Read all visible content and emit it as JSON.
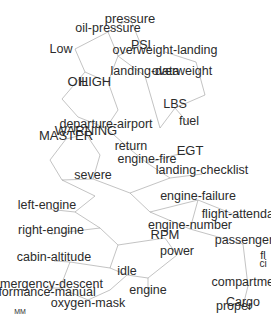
{
  "graph": {
    "title": "aviation-term-network",
    "background_color": "#ffffff",
    "edge_color": "#9a9a9a",
    "label_color": "#2b2b2b",
    "width": 271,
    "height": 324,
    "nodes": [
      {
        "label": "pressure",
        "x": 130,
        "y": 18,
        "size": 13
      },
      {
        "label": "oil-pressure",
        "x": 108,
        "y": 28,
        "size": 12.5
      },
      {
        "label": "PSI",
        "x": 141,
        "y": 45,
        "size": 12.5
      },
      {
        "label": "Low",
        "x": 61,
        "y": 49,
        "size": 12.5
      },
      {
        "label": "overweight-landing",
        "x": 165,
        "y": 50,
        "size": 12.5
      },
      {
        "label": "landing-data",
        "x": 145,
        "y": 71,
        "size": 12.5
      },
      {
        "label": "overweight",
        "x": 182,
        "y": 71,
        "size": 12.5
      },
      {
        "label": "OIL",
        "x": 78,
        "y": 81,
        "size": 13
      },
      {
        "label": "HIGH",
        "x": 95,
        "y": 81,
        "size": 13
      },
      {
        "label": "LBS",
        "x": 175,
        "y": 104,
        "size": 12.5
      },
      {
        "label": "departure-airport",
        "x": 106,
        "y": 124,
        "size": 12.5
      },
      {
        "label": "fuel",
        "x": 189,
        "y": 121,
        "size": 12.5
      },
      {
        "label": "WARNING",
        "x": 86,
        "y": 130,
        "size": 13
      },
      {
        "label": "MASTER",
        "x": 66,
        "y": 135,
        "size": 13
      },
      {
        "label": "return",
        "x": 131,
        "y": 146,
        "size": 12.5
      },
      {
        "label": "EGT",
        "x": 190,
        "y": 150,
        "size": 13
      },
      {
        "label": "engine-fire",
        "x": 147,
        "y": 159,
        "size": 12.5
      },
      {
        "label": "landing-checklist",
        "x": 202,
        "y": 170,
        "size": 12.5
      },
      {
        "label": "severe",
        "x": 93,
        "y": 175,
        "size": 12.5
      },
      {
        "label": "engine-failure",
        "x": 198,
        "y": 196,
        "size": 12.5
      },
      {
        "label": "left-engine",
        "x": 47,
        "y": 205,
        "size": 12.5
      },
      {
        "label": "flight-attendant",
        "x": 243,
        "y": 214,
        "size": 12.5
      },
      {
        "label": "engine-number",
        "x": 190,
        "y": 225,
        "size": 12.5
      },
      {
        "label": "right-engine",
        "x": 51,
        "y": 230,
        "size": 12.5
      },
      {
        "label": "RPM",
        "x": 165,
        "y": 234,
        "size": 13
      },
      {
        "label": "passenger",
        "x": 244,
        "y": 240,
        "size": 12.5
      },
      {
        "label": "power",
        "x": 177,
        "y": 251,
        "size": 12.5
      },
      {
        "label": "cabin-altitude",
        "x": 54,
        "y": 257,
        "size": 12.5
      },
      {
        "label": "fl",
        "x": 263,
        "y": 255,
        "size": 11
      },
      {
        "label": "ci",
        "x": 263,
        "y": 264,
        "size": 10
      },
      {
        "label": "idle",
        "x": 127,
        "y": 271,
        "size": 12.5
      },
      {
        "label": "emergency-descent",
        "x": 48,
        "y": 284,
        "size": 12.5
      },
      {
        "label": "compartment",
        "x": 248,
        "y": 282,
        "size": 12.5
      },
      {
        "label": "performance-manual",
        "x": 38,
        "y": 292,
        "size": 12.5
      },
      {
        "label": "engine",
        "x": 148,
        "y": 290,
        "size": 12.5
      },
      {
        "label": "oxygen-mask",
        "x": 88,
        "y": 303,
        "size": 12.5
      },
      {
        "label": "Cargo",
        "x": 243,
        "y": 302,
        "size": 12.5
      },
      {
        "label": "proper",
        "x": 234,
        "y": 306,
        "size": 12.5
      },
      {
        "label": "MM",
        "x": 20,
        "y": 311,
        "size": 7
      }
    ],
    "edges": [
      [
        130,
        18,
        108,
        32
      ],
      [
        130,
        18,
        141,
        45
      ],
      [
        108,
        32,
        75,
        49
      ],
      [
        108,
        32,
        118,
        56
      ],
      [
        141,
        45,
        118,
        56
      ],
      [
        75,
        49,
        85,
        72
      ],
      [
        118,
        56,
        145,
        76
      ],
      [
        118,
        56,
        108,
        82
      ],
      [
        165,
        52,
        196,
        62
      ],
      [
        196,
        62,
        205,
        95
      ],
      [
        205,
        95,
        175,
        108
      ],
      [
        175,
        108,
        189,
        124
      ],
      [
        175,
        108,
        160,
        128
      ],
      [
        145,
        76,
        160,
        128
      ],
      [
        108,
        82,
        85,
        72
      ],
      [
        85,
        72,
        62,
        99
      ],
      [
        108,
        82,
        118,
        110
      ],
      [
        62,
        99,
        78,
        117
      ],
      [
        78,
        117,
        106,
        128
      ],
      [
        118,
        110,
        106,
        128
      ],
      [
        106,
        128,
        131,
        150
      ],
      [
        131,
        150,
        147,
        163
      ],
      [
        147,
        163,
        175,
        155
      ],
      [
        175,
        155,
        190,
        153
      ],
      [
        147,
        163,
        170,
        178
      ],
      [
        170,
        178,
        202,
        174
      ],
      [
        66,
        139,
        50,
        160
      ],
      [
        86,
        134,
        66,
        139
      ],
      [
        86,
        134,
        100,
        155
      ],
      [
        100,
        155,
        93,
        179
      ],
      [
        50,
        160,
        62,
        180
      ],
      [
        62,
        180,
        93,
        179
      ],
      [
        93,
        179,
        130,
        193
      ],
      [
        130,
        193,
        170,
        178
      ],
      [
        130,
        193,
        150,
        212
      ],
      [
        150,
        212,
        198,
        200
      ],
      [
        198,
        200,
        243,
        218
      ],
      [
        150,
        212,
        190,
        229
      ],
      [
        190,
        229,
        243,
        244
      ],
      [
        95,
        196,
        62,
        180
      ],
      [
        95,
        196,
        75,
        212
      ],
      [
        75,
        212,
        47,
        209
      ],
      [
        75,
        212,
        100,
        228
      ],
      [
        100,
        228,
        51,
        234
      ],
      [
        100,
        228,
        118,
        245
      ],
      [
        118,
        245,
        165,
        238
      ],
      [
        165,
        238,
        177,
        255
      ],
      [
        177,
        255,
        148,
        278
      ],
      [
        118,
        245,
        110,
        268
      ],
      [
        110,
        268,
        127,
        275
      ],
      [
        127,
        275,
        148,
        278
      ],
      [
        110,
        268,
        70,
        262
      ],
      [
        70,
        262,
        54,
        261
      ],
      [
        70,
        262,
        60,
        288
      ],
      [
        60,
        288,
        48,
        288
      ],
      [
        60,
        288,
        88,
        300
      ],
      [
        88,
        300,
        110,
        290
      ],
      [
        110,
        290,
        127,
        275
      ],
      [
        148,
        278,
        148,
        294
      ],
      [
        243,
        244,
        248,
        286
      ],
      [
        248,
        286,
        243,
        306
      ],
      [
        190,
        229,
        198,
        200
      ]
    ]
  }
}
